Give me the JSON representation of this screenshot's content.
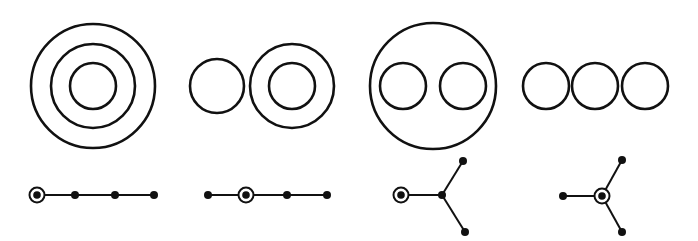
{
  "diagram": {
    "stroke_color": "#111111",
    "background": "#ffffff",
    "panels": [
      {
        "id": "panel-1",
        "circles": [
          {
            "cx": 93,
            "cy": 86,
            "r": 62
          },
          {
            "cx": 93,
            "cy": 86,
            "r": 42
          },
          {
            "cx": 93,
            "cy": 86,
            "r": 23
          }
        ],
        "tree": {
          "nodes": [
            {
              "x": 37,
              "y": 195,
              "root": true
            },
            {
              "x": 75,
              "y": 195,
              "root": false
            },
            {
              "x": 115,
              "y": 195,
              "root": false
            },
            {
              "x": 154,
              "y": 195,
              "root": false
            }
          ],
          "edges": [
            [
              0,
              1
            ],
            [
              1,
              2
            ],
            [
              2,
              3
            ]
          ]
        }
      },
      {
        "id": "panel-2",
        "circles": [
          {
            "cx": 217,
            "cy": 86,
            "r": 27
          },
          {
            "cx": 292,
            "cy": 86,
            "r": 42
          },
          {
            "cx": 292,
            "cy": 86,
            "r": 23
          }
        ],
        "tree": {
          "nodes": [
            {
              "x": 208,
              "y": 195,
              "root": false
            },
            {
              "x": 246,
              "y": 195,
              "root": true
            },
            {
              "x": 287,
              "y": 195,
              "root": false
            },
            {
              "x": 327,
              "y": 195,
              "root": false
            }
          ],
          "edges": [
            [
              0,
              1
            ],
            [
              1,
              2
            ],
            [
              2,
              3
            ]
          ]
        }
      },
      {
        "id": "panel-3",
        "circles": [
          {
            "cx": 433,
            "cy": 86,
            "r": 63
          },
          {
            "cx": 403,
            "cy": 86,
            "r": 23
          },
          {
            "cx": 463,
            "cy": 86,
            "r": 23
          }
        ],
        "tree": {
          "nodes": [
            {
              "x": 401,
              "y": 195,
              "root": true
            },
            {
              "x": 442,
              "y": 195,
              "root": false
            },
            {
              "x": 463,
              "y": 161,
              "root": false
            },
            {
              "x": 465,
              "y": 232,
              "root": false
            }
          ],
          "edges": [
            [
              0,
              1
            ],
            [
              1,
              2
            ],
            [
              1,
              3
            ]
          ]
        }
      },
      {
        "id": "panel-4",
        "circles": [
          {
            "cx": 546,
            "cy": 86,
            "r": 23
          },
          {
            "cx": 595,
            "cy": 86,
            "r": 23
          },
          {
            "cx": 645,
            "cy": 86,
            "r": 23
          }
        ],
        "tree": {
          "nodes": [
            {
              "x": 602,
              "y": 196,
              "root": true
            },
            {
              "x": 563,
              "y": 196,
              "root": false
            },
            {
              "x": 622,
              "y": 160,
              "root": false
            },
            {
              "x": 622,
              "y": 232,
              "root": false
            }
          ],
          "edges": [
            [
              0,
              1
            ],
            [
              0,
              2
            ],
            [
              0,
              3
            ]
          ]
        }
      }
    ]
  }
}
